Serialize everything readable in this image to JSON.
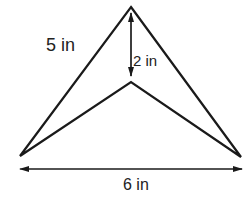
{
  "diagram": {
    "shape": "concave quadrilateral (arrowhead / dart)",
    "labels": {
      "side": "5 in",
      "height": "2 in",
      "base": "6 in"
    },
    "colors": {
      "stroke": "#1a1a1a",
      "text": "#222222",
      "background": "#ffffff"
    }
  }
}
